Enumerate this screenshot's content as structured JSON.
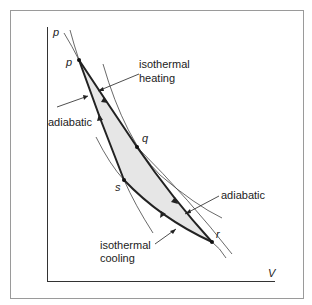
{
  "diagram": {
    "axes": {
      "y_label": "p",
      "x_label": "V"
    },
    "points": {
      "p": "p",
      "q": "q",
      "r": "r",
      "s": "s"
    },
    "annotations": {
      "isothermal_heating_line1": "isothermal",
      "isothermal_heating_line2": "heating",
      "adiabatic_left": "adiabatic",
      "adiabatic_right": "adiabatic",
      "isothermal_cooling_line1": "isothermal",
      "isothermal_cooling_line2": "cooling"
    },
    "colors": {
      "frame": "#9a9a9a",
      "axis": "#333333",
      "curve": "#222222",
      "thin_curve": "#444444",
      "fill": "#e6e6e6"
    }
  }
}
